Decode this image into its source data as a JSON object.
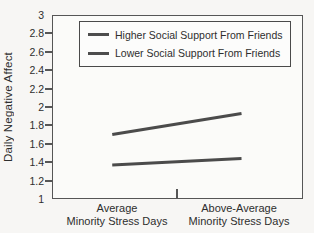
{
  "chart_data": {
    "type": "line",
    "ylabel": "Daily Negative Affect",
    "ylim": [
      1,
      3
    ],
    "ytick_step": 0.2,
    "yticks": [
      3,
      2.8,
      2.6,
      2.4,
      2.2,
      2,
      1.8,
      1.6,
      1.4,
      1.2,
      1
    ],
    "ytick_labels": [
      "3",
      "2.8",
      "2.6",
      "2.4",
      "2.2",
      "2",
      "1.8",
      "1.6",
      "1.4",
      "1.2",
      "1"
    ],
    "categories": [
      {
        "line1": "Average",
        "line2": "Minority Stress Days"
      },
      {
        "line1": "Above-Average",
        "line2": "Minority Stress Days"
      }
    ],
    "series": [
      {
        "name": "Higher Social Support From Friends",
        "values": [
          1.7,
          1.93
        ],
        "color": "#4b4b4b"
      },
      {
        "name": "Lower Social Support From Friends",
        "values": [
          1.37,
          1.44
        ],
        "color": "#4b4b4b"
      }
    ],
    "grid": false,
    "legend_position": "top-left-inside"
  },
  "colors": {
    "line": "#4b4b4b",
    "axis": "#565656",
    "text": "#2e2e2e",
    "background": "#f7f6f4",
    "plot_background": "#fbfbf9"
  }
}
